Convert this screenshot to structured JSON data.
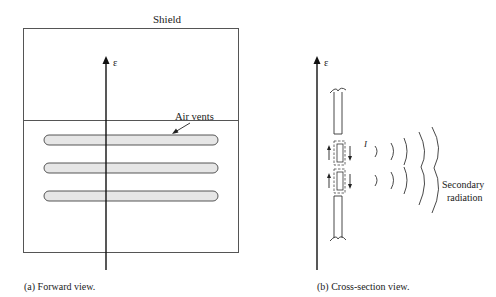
{
  "panel_a": {
    "title": "Shield",
    "field_label": "ε",
    "vent_label": "Air vents",
    "vent_count": 3,
    "caption": "(a) Forward view."
  },
  "panel_b": {
    "field_label": "ε",
    "current_label": "I",
    "radiation_label_line1": "Secondary",
    "radiation_label_line2": "radiation",
    "caption": "(b) Cross-section view."
  },
  "colors": {
    "line": "#222222",
    "vent_fill": "#e6e6e6",
    "shield_border": "#555555"
  }
}
